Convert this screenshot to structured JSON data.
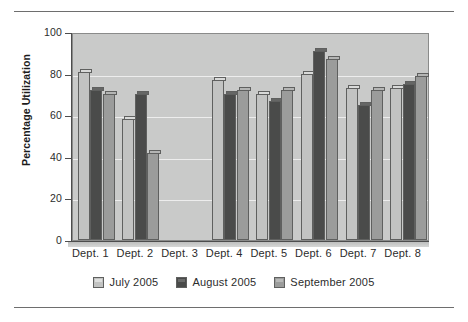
{
  "chart_data": {
    "type": "bar",
    "title": "",
    "xlabel": "",
    "ylabel": "Percentage Utilization",
    "ylim": [
      0,
      100
    ],
    "yticks": [
      0,
      20,
      40,
      60,
      80,
      100
    ],
    "ytick_labels": [
      "0",
      "20",
      "40",
      "60",
      "80",
      "100"
    ],
    "grid": true,
    "legend_position": "bottom",
    "categories": [
      "Dept. 1",
      "Dept. 2",
      "Dept. 3",
      "Dept. 4",
      "Dept. 5",
      "Dept. 6",
      "Dept. 7",
      "Dept. 8"
    ],
    "series": [
      {
        "name": "July 2005",
        "color": "#c2c3c2",
        "values": [
          81,
          58,
          0,
          77,
          70,
          80,
          73,
          73
        ]
      },
      {
        "name": "August 2005",
        "color": "#4a4b4a",
        "values": [
          72,
          70,
          0,
          70,
          67,
          91,
          65,
          75
        ]
      },
      {
        "name": "September 2005",
        "color": "#9b9c9b",
        "values": [
          70,
          42,
          0,
          72,
          72,
          87,
          72,
          79
        ]
      }
    ]
  },
  "colors": {
    "plot_background": "#c9cac9",
    "gridline": "#ededed",
    "axis": "#4d4d4d",
    "bar_outline": "#5f605f",
    "text": "#2c2c2c",
    "rule": "#6e6e6e",
    "page_background": "#ffffff"
  }
}
